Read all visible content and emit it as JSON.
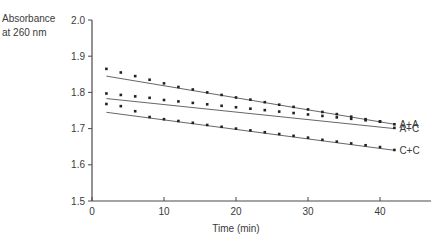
{
  "chart_data": {
    "type": "scatter",
    "title": "",
    "xlabel": "Time (min)",
    "ylabel": [
      "Absorbance",
      "at 260 nm"
    ],
    "xlim": [
      0,
      47
    ],
    "ylim": [
      1.5,
      2.0
    ],
    "x_ticks": [
      "0",
      "10",
      "20",
      "30",
      "40"
    ],
    "x_tick_values": [
      0,
      10,
      20,
      30,
      40
    ],
    "y_ticks": [
      "1.5",
      "1.6",
      "1.7",
      "1.8",
      "1.9",
      "2.0"
    ],
    "y_tick_values": [
      1.5,
      1.6,
      1.7,
      1.8,
      1.9,
      2.0
    ],
    "grid": false,
    "legend_position": "inline-right",
    "x": [
      2,
      4,
      6,
      8,
      10,
      12,
      14,
      16,
      18,
      20,
      22,
      24,
      26,
      28,
      30,
      32,
      34,
      36,
      38,
      40,
      42
    ],
    "series": [
      {
        "name": "A+A",
        "values": [
          1.865,
          1.855,
          1.845,
          1.835,
          1.825,
          1.815,
          1.808,
          1.8,
          1.793,
          1.786,
          1.78,
          1.773,
          1.766,
          1.76,
          1.753,
          1.746,
          1.74,
          1.733,
          1.726,
          1.72,
          1.712
        ],
        "fit_line": {
          "x": [
            2,
            42
          ],
          "y": [
            1.845,
            1.712
          ]
        }
      },
      {
        "name": "A+C",
        "values": [
          1.797,
          1.793,
          1.789,
          1.785,
          1.779,
          1.775,
          1.771,
          1.767,
          1.763,
          1.759,
          1.755,
          1.751,
          1.747,
          1.743,
          1.739,
          1.735,
          1.731,
          1.727,
          1.723,
          1.719,
          1.702
        ],
        "fit_line": {
          "x": [
            2,
            42
          ],
          "y": [
            1.783,
            1.7
          ]
        }
      },
      {
        "name": "C+C",
        "values": [
          1.768,
          1.762,
          1.748,
          1.732,
          1.726,
          1.721,
          1.716,
          1.71,
          1.705,
          1.7,
          1.695,
          1.69,
          1.685,
          1.68,
          1.675,
          1.669,
          1.664,
          1.659,
          1.654,
          1.649,
          1.641
        ],
        "fit_line": {
          "x": [
            2,
            42
          ],
          "y": [
            1.745,
            1.64
          ]
        }
      }
    ]
  }
}
